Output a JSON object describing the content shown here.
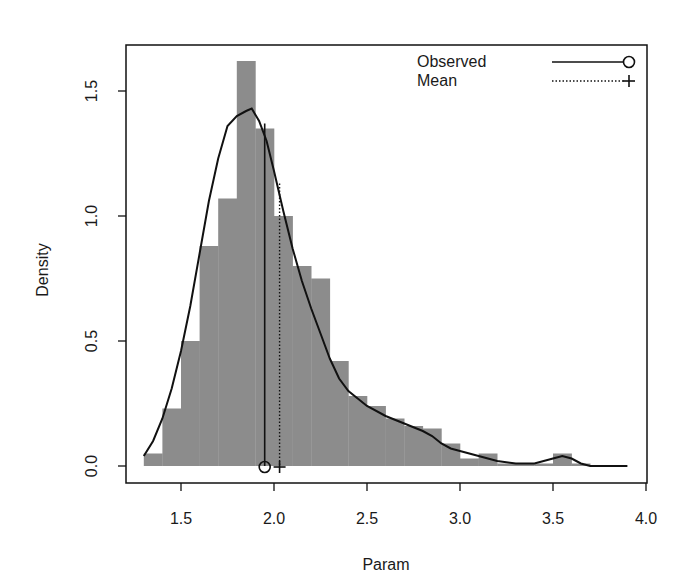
{
  "chart_data": {
    "type": "bar",
    "subtype": "histogram_with_density",
    "title": "",
    "xlabel": "Param",
    "ylabel": "Density",
    "xlim": [
      1.2,
      4.0
    ],
    "ylim": [
      0.0,
      1.7
    ],
    "xticks": [
      1.5,
      2.0,
      2.5,
      3.0,
      3.5,
      4.0
    ],
    "xtick_labels": [
      "1.5",
      "2.0",
      "2.5",
      "3.0",
      "3.5",
      "4.0"
    ],
    "yticks": [
      0.0,
      0.5,
      1.0,
      1.5
    ],
    "ytick_labels": [
      "0.0",
      "0.5",
      "1.0",
      "1.5"
    ],
    "grid": false,
    "bar_color": "#8c8c8c",
    "bin_width": 0.1,
    "histogram": {
      "bin_starts": [
        1.3,
        1.4,
        1.5,
        1.6,
        1.7,
        1.8,
        1.9,
        2.0,
        2.1,
        2.2,
        2.3,
        2.4,
        2.5,
        2.6,
        2.7,
        2.8,
        2.9,
        3.0,
        3.1,
        3.2,
        3.3,
        3.4,
        3.5,
        3.6
      ],
      "density": [
        0.05,
        0.23,
        0.5,
        0.88,
        1.07,
        1.62,
        1.35,
        1.0,
        0.8,
        0.75,
        0.42,
        0.28,
        0.24,
        0.19,
        0.16,
        0.15,
        0.09,
        0.03,
        0.05,
        0.01,
        0.01,
        0.01,
        0.05,
        0.01
      ]
    },
    "density_curve": {
      "x": [
        1.3,
        1.35,
        1.4,
        1.45,
        1.5,
        1.55,
        1.6,
        1.65,
        1.7,
        1.75,
        1.8,
        1.85,
        1.88,
        1.92,
        1.96,
        2.0,
        2.05,
        2.1,
        2.15,
        2.2,
        2.25,
        2.3,
        2.35,
        2.4,
        2.45,
        2.5,
        2.6,
        2.7,
        2.8,
        2.85,
        2.9,
        2.95,
        3.0,
        3.1,
        3.2,
        3.3,
        3.4,
        3.5,
        3.55,
        3.6,
        3.65,
        3.7,
        3.8,
        3.9
      ],
      "y": [
        0.04,
        0.1,
        0.19,
        0.31,
        0.46,
        0.64,
        0.85,
        1.06,
        1.23,
        1.36,
        1.4,
        1.42,
        1.43,
        1.38,
        1.3,
        1.18,
        1.02,
        0.87,
        0.74,
        0.63,
        0.53,
        0.43,
        0.35,
        0.3,
        0.27,
        0.24,
        0.2,
        0.17,
        0.14,
        0.12,
        0.09,
        0.07,
        0.06,
        0.04,
        0.02,
        0.01,
        0.01,
        0.03,
        0.04,
        0.03,
        0.01,
        0.0,
        0.0,
        0.0
      ]
    },
    "markers": [
      {
        "name": "Observed",
        "x": 1.95,
        "line_top": 1.37,
        "line_style": "solid",
        "symbol": "circle"
      },
      {
        "name": "Mean",
        "x": 2.03,
        "line_top": 1.13,
        "line_style": "dotted",
        "symbol": "plus"
      }
    ],
    "legend": {
      "position": "top-right",
      "entries": [
        {
          "label": "Observed",
          "line_style": "solid",
          "symbol": "circle"
        },
        {
          "label": "Mean",
          "line_style": "dotted",
          "symbol": "plus"
        }
      ]
    }
  }
}
